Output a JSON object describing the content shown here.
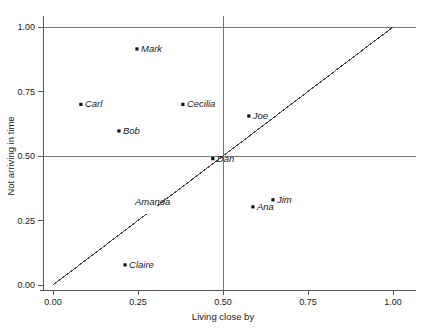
{
  "chart_data": {
    "type": "scatter",
    "title": "",
    "xlabel": "Living close by",
    "ylabel": "Not arriving in time",
    "xlim": [
      -0.03,
      1.05
    ],
    "ylim": [
      -0.03,
      1.05
    ],
    "xticks": [
      "0.00",
      "0.25",
      "0.50",
      "0.75",
      "1.00"
    ],
    "xtick_values": [
      0.0,
      0.25,
      0.5,
      0.75,
      1.0
    ],
    "yticks": [
      "0.00",
      "0.25",
      "0.50",
      "0.75",
      "1.00"
    ],
    "ytick_values": [
      0.0,
      0.25,
      0.5,
      0.75,
      1.0
    ],
    "grid": "reference lines at x=0.50, y=0.50 and y=1.00",
    "gridlines_x": [
      0.5
    ],
    "gridlines_y": [
      0.5,
      1.0
    ],
    "legend": "none",
    "reference_line": {
      "name": "identity-line",
      "from": [
        0.0,
        0.0
      ],
      "to": [
        1.0,
        1.0
      ],
      "note": "y = x diagonal, broken with a small gap near x = 0.29"
    },
    "points": [
      {
        "label": "Mark",
        "x": 0.247,
        "y": 0.915,
        "marker": true,
        "label_dx": 4,
        "label_dy": 0
      },
      {
        "label": "Carl",
        "x": 0.082,
        "y": 0.7,
        "marker": true,
        "label_dx": 4,
        "label_dy": 0
      },
      {
        "label": "Cecilia",
        "x": 0.382,
        "y": 0.7,
        "marker": true,
        "label_dx": 4,
        "label_dy": 0
      },
      {
        "label": "Bob",
        "x": 0.194,
        "y": 0.597,
        "marker": true,
        "label_dx": 4,
        "label_dy": 0
      },
      {
        "label": "Joe",
        "x": 0.576,
        "y": 0.655,
        "marker": true,
        "label_dx": 4,
        "label_dy": 0
      },
      {
        "label": "Dan",
        "x": 0.47,
        "y": 0.49,
        "marker": true,
        "label_dx": 4,
        "label_dy": 0
      },
      {
        "label": "Jim",
        "x": 0.647,
        "y": 0.33,
        "marker": true,
        "label_dx": 4,
        "label_dy": 0
      },
      {
        "label": "Ana",
        "x": 0.588,
        "y": 0.303,
        "marker": true,
        "label_dx": 4,
        "label_dy": 0
      },
      {
        "label": "Claire",
        "x": 0.212,
        "y": 0.078,
        "marker": true,
        "label_dx": 4,
        "label_dy": 0
      },
      {
        "label": "Amanda",
        "x": 0.3,
        "y": 0.32,
        "marker": false,
        "label_dx": -20,
        "label_dy": 0
      }
    ]
  }
}
